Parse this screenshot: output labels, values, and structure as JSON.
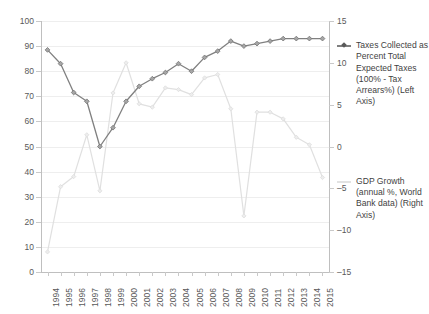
{
  "chart_data": {
    "type": "line",
    "title": "",
    "xlabel": "",
    "ylabel": "",
    "grid": true,
    "legend_position": "right",
    "categories": [
      "1994",
      "1995",
      "1996",
      "1997",
      "1998",
      "1999",
      "2000",
      "2001",
      "2002",
      "2003",
      "2004",
      "2005",
      "2006",
      "2007",
      "2008",
      "2009",
      "2010",
      "2011",
      "2012",
      "2013",
      "2014",
      "2015"
    ],
    "axes": {
      "left": {
        "label": "Taxes Collected as Percent Total Expected Taxes",
        "ylim": [
          0,
          100
        ],
        "ticks": [
          0,
          10,
          20,
          30,
          40,
          50,
          60,
          70,
          80,
          90,
          100
        ],
        "tick_labels": [
          "0",
          "10",
          "20",
          "30",
          "40",
          "50",
          "60",
          "70",
          "80",
          "90",
          "100"
        ]
      },
      "right": {
        "label": "GDP Growth (annual %, World Bank data)",
        "ylim": [
          -15,
          15
        ],
        "ticks": [
          -15,
          -10,
          -5,
          0,
          5,
          10,
          15
        ],
        "tick_labels": [
          "–15",
          "–10",
          "–5",
          "0",
          "5",
          "10",
          "15"
        ]
      }
    },
    "series": [
      {
        "name": "Taxes Collected as Percent Total Expected Taxes (100% - Tax Arrears%) (Left Axis)",
        "axis": "left",
        "color": "#808080",
        "marker": "diamond",
        "values": [
          88.5,
          83.0,
          71.5,
          68.0,
          50.0,
          57.5,
          68.0,
          74.0,
          77.0,
          79.5,
          83.0,
          80.0,
          85.5,
          88.0,
          92.0,
          90.0,
          91.0,
          92.0,
          93.0,
          93.0,
          93.0,
          93.0
        ]
      },
      {
        "name": "GDP Growth (annual %, World Bank data) (Right Axis)",
        "axis": "right",
        "color": "#e0e0e0",
        "marker": "diamond",
        "values": [
          -12.6,
          -4.8,
          -3.6,
          1.4,
          -5.3,
          6.4,
          10.0,
          5.1,
          4.7,
          7.0,
          6.8,
          6.2,
          8.2,
          8.6,
          4.5,
          -8.3,
          4.1,
          4.1,
          3.3,
          1.1,
          0.2,
          -3.7
        ]
      }
    ]
  },
  "legend": {
    "entries": [
      {
        "id": "taxes",
        "label": "Taxes Collected as Percent Total Expected Taxes (100% - Tax Arrears%) (Left Axis)",
        "color": "#808080"
      },
      {
        "id": "gdp",
        "label": "GDP Growth (annual %, World Bank data) (Right Axis)",
        "color": "#e0e0e0"
      }
    ]
  }
}
